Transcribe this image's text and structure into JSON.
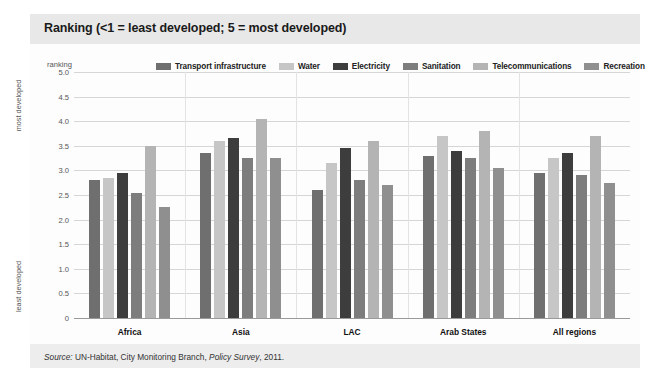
{
  "title": "Ranking (<1 = least developed; 5 = most developed)",
  "axis": {
    "ranking_label": "ranking",
    "most_developed": "most developed",
    "least_developed": "least developed"
  },
  "source": {
    "prefix": "Source:",
    "text": " UN-Habitat, City Monitoring Branch, ",
    "italic_work": "Policy Survey",
    "suffix": ", 2011."
  },
  "chart_data": {
    "type": "bar",
    "title": "Ranking (<1 = least developed; 5 = most developed)",
    "xlabel": "",
    "ylabel": "ranking",
    "ylim": [
      0,
      5
    ],
    "ytick_labels": [
      "5.0",
      "4.5",
      "4.0",
      "3.5",
      "3.0",
      "2.5",
      "2.0",
      "1.5",
      "1.0",
      "0.5",
      "0"
    ],
    "ytick_values": [
      5.0,
      4.5,
      4.0,
      3.5,
      3.0,
      2.5,
      2.0,
      1.5,
      1.0,
      0.5,
      0
    ],
    "grid": true,
    "legend_position": "top",
    "categories": [
      "Africa",
      "Asia",
      "LAC",
      "Arab States",
      "All regions"
    ],
    "series": [
      {
        "name": "Transport infrastructure",
        "color": "#6f6f6f",
        "values": [
          2.8,
          3.35,
          2.6,
          3.3,
          2.95
        ]
      },
      {
        "name": "Water",
        "color": "#c6c6c6",
        "values": [
          2.85,
          3.6,
          3.15,
          3.7,
          3.25
        ]
      },
      {
        "name": "Electricity",
        "color": "#3d3d3d",
        "values": [
          2.95,
          3.65,
          3.45,
          3.4,
          3.35
        ]
      },
      {
        "name": "Sanitation",
        "color": "#7d7d7d",
        "values": [
          2.55,
          3.25,
          2.8,
          3.25,
          2.9
        ]
      },
      {
        "name": "Telecommunications",
        "color": "#b4b4b4",
        "values": [
          3.5,
          4.05,
          3.6,
          3.8,
          3.7
        ]
      },
      {
        "name": "Recreation",
        "color": "#8f8f8f",
        "values": [
          2.25,
          3.25,
          2.7,
          3.05,
          2.75
        ]
      }
    ]
  }
}
